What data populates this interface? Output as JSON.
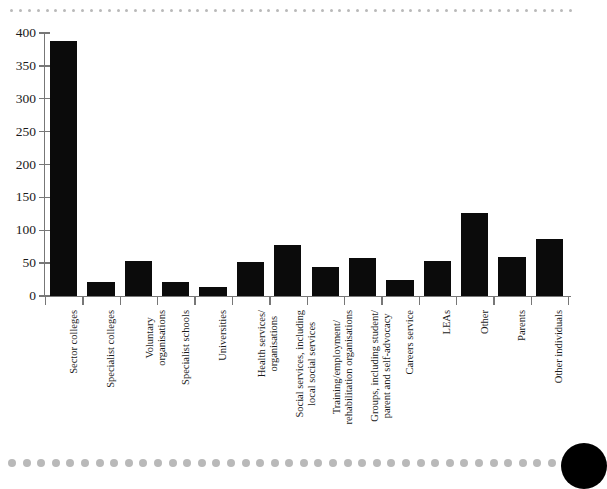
{
  "decoration": {
    "top_dot_count": 64,
    "bottom_dot_count": 38,
    "dot_color": "#b9b9b9",
    "corner_circle_color": "#000000"
  },
  "chart_data": {
    "type": "bar",
    "title": "",
    "subtitle": "",
    "xlabel": "",
    "ylabel": "",
    "ylim": [
      0,
      400
    ],
    "yticks": [
      0,
      50,
      100,
      150,
      200,
      250,
      300,
      350,
      400
    ],
    "ytick_labels": [
      "0",
      "50",
      "100",
      "150",
      "200",
      "250",
      "300",
      "350",
      "400"
    ],
    "grid": false,
    "legend": null,
    "bar_color": "#0b0b0b",
    "axis_color": "#777777",
    "categories": [
      "Sector colleges",
      "Specialist colleges",
      "Voluntary organisations",
      "Specialist schools",
      "Universities",
      "Health services/ organisations",
      "Social services, including local social services",
      "Training/employment/ rehabilitation organisations",
      "Groups, including student/ parent and self-advocacy",
      "Careers service",
      "LEAs",
      "Other",
      "Parents",
      "Other individuals"
    ],
    "category_lines": [
      [
        "Sector colleges"
      ],
      [
        "Specialist colleges"
      ],
      [
        "Voluntary",
        "organisations"
      ],
      [
        "Specialist schools"
      ],
      [
        "Universities"
      ],
      [
        "Health services/",
        "organisations"
      ],
      [
        "Social services, including",
        "local social services"
      ],
      [
        "Training/employment/",
        "rehabilitation organisations"
      ],
      [
        "Groups, including student/",
        "parent and self-advocacy"
      ],
      [
        "Careers service"
      ],
      [
        "LEAs"
      ],
      [
        "Other"
      ],
      [
        "Parents"
      ],
      [
        "Other individuals"
      ]
    ],
    "values": [
      388,
      21,
      53,
      21,
      14,
      52,
      78,
      44,
      58,
      24,
      53,
      127,
      60,
      87
    ]
  }
}
